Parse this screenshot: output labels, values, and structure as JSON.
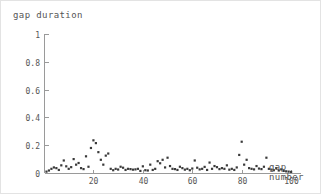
{
  "chart_data": {
    "type": "scatter",
    "title": "gap duration",
    "xlabel_line1": "gap",
    "xlabel_line2": "number",
    "ylabel": "gap duration",
    "xlim": [
      0,
      104
    ],
    "ylim": [
      0,
      1
    ],
    "grid": false,
    "legend": null,
    "marker": "square",
    "marker_color": "#3a3a3a",
    "axis_color": "#9a9a9a",
    "x_ticks": [
      {
        "value": 20,
        "label": "20"
      },
      {
        "value": 40,
        "label": "40"
      },
      {
        "value": 60,
        "label": "60"
      },
      {
        "value": 80,
        "label": "80"
      },
      {
        "value": 100,
        "label": "100"
      }
    ],
    "y_ticks": [
      {
        "value": 0,
        "label": "0"
      },
      {
        "value": 0.2,
        "label": "0.2"
      },
      {
        "value": 0.4,
        "label": "0.4"
      },
      {
        "value": 0.6,
        "label": "0.6"
      },
      {
        "value": 0.8,
        "label": "0.8"
      },
      {
        "value": 1,
        "label": "1"
      }
    ],
    "x": [
      1,
      2,
      3,
      4,
      5,
      6,
      7,
      8,
      9,
      10,
      11,
      12,
      13,
      14,
      15,
      16,
      17,
      18,
      19,
      20,
      21,
      22,
      23,
      24,
      25,
      26,
      27,
      28,
      29,
      30,
      31,
      32,
      33,
      34,
      35,
      36,
      37,
      38,
      39,
      40,
      41,
      42,
      43,
      44,
      45,
      46,
      47,
      48,
      49,
      50,
      51,
      52,
      53,
      54,
      55,
      56,
      57,
      58,
      59,
      60,
      61,
      62,
      63,
      64,
      65,
      66,
      67,
      68,
      69,
      70,
      71,
      72,
      73,
      74,
      75,
      76,
      77,
      78,
      79,
      80,
      81,
      82,
      83,
      84,
      85,
      86,
      87,
      88,
      89,
      90,
      91,
      92,
      93,
      94,
      95,
      96,
      97,
      98,
      99,
      100
    ],
    "y": [
      0.01,
      0.018,
      0.03,
      0.04,
      0.035,
      0.022,
      0.055,
      0.09,
      0.048,
      0.03,
      0.042,
      0.1,
      0.06,
      0.072,
      0.035,
      0.028,
      0.12,
      0.045,
      0.18,
      0.235,
      0.215,
      0.15,
      0.095,
      0.06,
      0.125,
      0.14,
      0.03,
      0.02,
      0.03,
      0.025,
      0.045,
      0.038,
      0.022,
      0.03,
      0.028,
      0.024,
      0.026,
      0.03,
      0.015,
      0.048,
      0.02,
      0.018,
      0.06,
      0.022,
      0.03,
      0.085,
      0.07,
      0.095,
      0.04,
      0.11,
      0.05,
      0.03,
      0.028,
      0.022,
      0.045,
      0.035,
      0.024,
      0.03,
      0.02,
      0.032,
      0.09,
      0.038,
      0.026,
      0.03,
      0.044,
      0.022,
      0.075,
      0.03,
      0.05,
      0.042,
      0.028,
      0.035,
      0.03,
      0.055,
      0.024,
      0.03,
      0.022,
      0.04,
      0.13,
      0.225,
      0.06,
      0.095,
      0.035,
      0.03,
      0.026,
      0.05,
      0.032,
      0.028,
      0.045,
      0.11,
      0.03,
      0.024,
      0.02,
      0.035,
      0.018,
      0.026,
      0.015,
      0.012,
      0.01,
      0.008
    ]
  }
}
